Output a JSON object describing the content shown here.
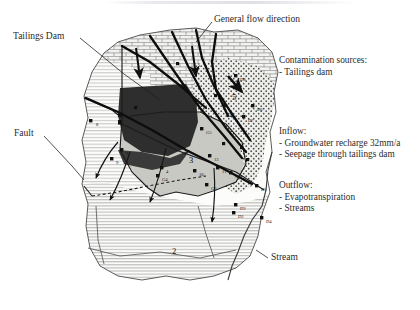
{
  "figure": {
    "type": "hydrogeological-site-map",
    "annotations": {
      "general_flow_direction": "General flow direction",
      "tailings_dam": "Tailings Dam",
      "fault": "Fault",
      "stream": "Stream"
    },
    "legend_blocks": [
      {
        "id": "contamination",
        "heading": "Contamination sources:",
        "items": [
          "- Tailings dam"
        ]
      },
      {
        "id": "inflow",
        "heading": "Inflow:",
        "items": [
          "- Groundwater recharge 32mm/a",
          "- Seepage through tailings dam"
        ]
      },
      {
        "id": "outflow",
        "heading": "Outflow:",
        "items": [
          "- Evapotranspiration",
          "- Streams"
        ]
      }
    ],
    "region_labels": [
      {
        "id": "region-2",
        "text": "2",
        "x": 172,
        "y": 246
      },
      {
        "id": "region-3",
        "text": "3",
        "x": 189,
        "y": 155
      },
      {
        "id": "region-4",
        "text": "4",
        "x": 229,
        "y": 110
      },
      {
        "id": "region-5",
        "text": "5",
        "x": 232,
        "y": 92
      }
    ],
    "sample_points": [
      {
        "id": "p-8",
        "label": "8",
        "x": 96,
        "y": 122
      },
      {
        "id": "p-9",
        "label": "9",
        "x": 116,
        "y": 160
      },
      {
        "id": "p-7",
        "label": "7",
        "x": 126,
        "y": 151
      },
      {
        "id": "p-4",
        "label": "4",
        "x": 166,
        "y": 169
      },
      {
        "id": "p-G4",
        "label": "G4",
        "x": 162,
        "y": 177
      },
      {
        "id": "p-10",
        "label": "10",
        "x": 199,
        "y": 172
      },
      {
        "id": "p-13",
        "label": "13",
        "x": 214,
        "y": 157
      },
      {
        "id": "p-G3",
        "label": "G3",
        "x": 211,
        "y": 186
      },
      {
        "id": "p-G5",
        "label": "G5",
        "x": 206,
        "y": 130
      },
      {
        "id": "p-11",
        "label": "11",
        "x": 222,
        "y": 169
      },
      {
        "id": "p-G2",
        "label": "G2",
        "x": 235,
        "y": 174
      },
      {
        "id": "p-D8",
        "label": "D8",
        "x": 240,
        "y": 77
      },
      {
        "id": "p-D6",
        "label": "D6",
        "x": 257,
        "y": 107
      },
      {
        "id": "p-D7",
        "label": "D7",
        "x": 248,
        "y": 118
      },
      {
        "id": "p-D5",
        "label": "D5",
        "x": 261,
        "y": 187
      },
      {
        "id": "p-D4",
        "label": "D4",
        "x": 266,
        "y": 219
      },
      {
        "id": "p-D3",
        "label": "D3",
        "x": 240,
        "y": 206
      },
      {
        "id": "p-D2",
        "label": "D2",
        "x": 238,
        "y": 214
      }
    ],
    "colors": {
      "ink": "#1a1a1a",
      "text": "#2b2b2b",
      "pond_fill": "#2e2e2e",
      "alluvium_fill": "#c9c9c4",
      "paper": "#ffffff"
    }
  }
}
